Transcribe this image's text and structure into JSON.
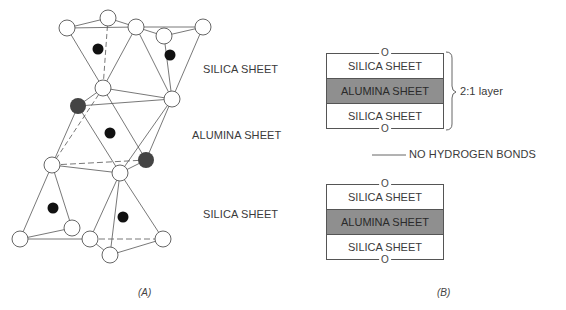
{
  "panel_a": {
    "caption": "(A)",
    "labels": {
      "top_silica": "SILICA SHEET",
      "alumina": "ALUMINA SHEET",
      "bottom_silica": "SILICA SHEET"
    },
    "legend_colors": {
      "oxygen": "#ffffff",
      "silicon": "#111111",
      "hydroxyl": "#444444"
    }
  },
  "panel_b": {
    "caption": "(B)",
    "upper_layer": {
      "rows": [
        "SILICA SHEET",
        "ALUMINA SHEET",
        "SILICA SHEET"
      ],
      "top_marker": "O",
      "bottom_marker": "O"
    },
    "bracket_label": "2:1 layer",
    "interlayer_label": "NO HYDROGEN BONDS",
    "lower_layer": {
      "rows": [
        "SILICA SHEET",
        "ALUMINA SHEET",
        "SILICA SHEET"
      ],
      "top_marker": "O",
      "bottom_marker": "O"
    },
    "alumina_color": "#8f8f8f"
  }
}
